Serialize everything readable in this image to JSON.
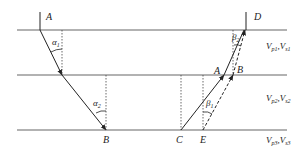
{
  "diagram": {
    "title": "",
    "layers": [
      {
        "id": 1,
        "label": "V",
        "sub1": "p1",
        "sep": ",",
        "label2": "V",
        "sub2": "s1",
        "y": 30
      },
      {
        "id": 2,
        "label": "V",
        "sub1": "p2",
        "sep": ",",
        "label2": "V",
        "sub2": "s2",
        "y": 75
      },
      {
        "id": 3,
        "label": "V",
        "sub1": "p3",
        "sep": ",",
        "label2": "V",
        "sub2": "s3",
        "y": 130
      }
    ],
    "points": {
      "A_top": "A",
      "D": "D",
      "B_bottom": "B",
      "C": "C",
      "E": "E",
      "A_mid": "A",
      "B_mid": "B"
    },
    "angles": {
      "alpha1": {
        "sym": "α",
        "sub": "1"
      },
      "alpha2": {
        "sym": "α",
        "sub": "2"
      },
      "beta1": {
        "sym": "β",
        "sub": "1"
      },
      "beta2": {
        "sym": "β",
        "sub": "2"
      }
    },
    "colors": {
      "line": "#555555",
      "ray": "#222222",
      "text": "#222222"
    }
  }
}
